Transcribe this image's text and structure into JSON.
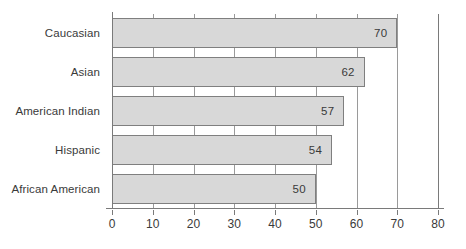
{
  "chart_data": {
    "type": "bar",
    "orientation": "horizontal",
    "title": "",
    "subtitle": "",
    "xlabel": "",
    "ylabel": "",
    "categories": [
      "Caucasian",
      "Asian",
      "American Indian",
      "Hispanic",
      "African American"
    ],
    "values": [
      70,
      62,
      57,
      54,
      50
    ],
    "value_labels": [
      "70",
      "62",
      "57",
      "54",
      "50"
    ],
    "xlim": [
      0,
      80
    ],
    "xticks": [
      0,
      10,
      20,
      30,
      40,
      50,
      60,
      70,
      80
    ],
    "xtick_labels": [
      "0",
      "10",
      "20",
      "30",
      "40",
      "50",
      "60",
      "70",
      "80"
    ],
    "grid": true,
    "grid_axis": "x",
    "legend": false,
    "legend_position": "none",
    "series": [
      {
        "name": "",
        "values": [
          70,
          62,
          57,
          54,
          50
        ]
      }
    ]
  },
  "style": {
    "bar_fill": "#d8d8d8",
    "bar_border": "#7f7f7f",
    "grid_color": "#9a9a9a",
    "axis_color": "#7a7a7a",
    "text_color": "#3a3a3a",
    "background": "#ffffff"
  }
}
